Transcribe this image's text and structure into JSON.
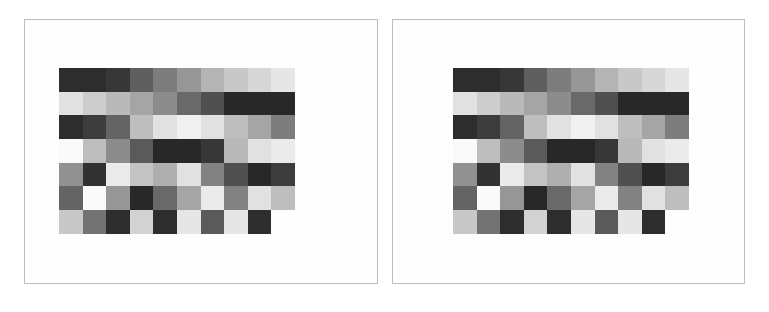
{
  "figure": {
    "panels": [
      {
        "id": "left",
        "label": ""
      },
      {
        "id": "right",
        "label": ""
      }
    ],
    "grid": {
      "rows": 7,
      "cols": 10,
      "encoding": "grayscale 0=black 255=white, null=empty",
      "values": [
        [
          45,
          45,
          55,
          95,
          125,
          150,
          180,
          200,
          215,
          230
        ],
        [
          225,
          205,
          185,
          165,
          140,
          105,
          80,
          40,
          40,
          40
        ],
        [
          45,
          60,
          100,
          190,
          225,
          240,
          225,
          190,
          165,
          125
        ],
        [
          250,
          190,
          140,
          90,
          40,
          40,
          55,
          185,
          225,
          235
        ],
        [
          145,
          50,
          235,
          195,
          175,
          225,
          130,
          80,
          40,
          60
        ],
        [
          100,
          250,
          150,
          40,
          105,
          165,
          235,
          130,
          225,
          190
        ],
        [
          200,
          115,
          45,
          210,
          45,
          230,
          90,
          230,
          45,
          null
        ]
      ]
    },
    "colors": {
      "panel_border": "#bdbdbd",
      "background": "#ffffff"
    }
  }
}
